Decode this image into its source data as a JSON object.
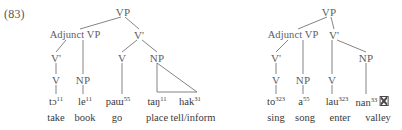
{
  "example": {
    "number_label": "(83)"
  },
  "trees": [
    {
      "id": "tree-left",
      "nodes": {
        "root": "VP",
        "adjunct_vp": "Adjunct VP",
        "v_bar_main": "V'",
        "adjunct_v_bar": "V'",
        "adjunct_v": "V",
        "adjunct_np": "NP",
        "main_v": "V",
        "main_np": "NP"
      },
      "terminals": [
        {
          "ipa_base": "tɔ",
          "ipa_tone": "11",
          "gloss": "take"
        },
        {
          "ipa_base": "le",
          "ipa_tone": "11",
          "gloss": "book"
        },
        {
          "ipa_base": "paɯ",
          "ipa_tone": "55",
          "gloss": "go"
        },
        {
          "ipa_base": "taŋ",
          "ipa_tone": "11",
          "gloss": "place"
        },
        {
          "ipa_base": "hak",
          "ipa_tone": "31",
          "gloss": "tell/inform"
        }
      ]
    },
    {
      "id": "tree-right",
      "nodes": {
        "root": "VP",
        "adjunct_vp": "Adjunct VP",
        "v_bar_main": "V'",
        "adjunct_v_bar": "V'",
        "adjunct_v": "V",
        "adjunct_np": "NP",
        "main_v": "V",
        "main_np": "NP"
      },
      "terminals": [
        {
          "ipa_base": "to",
          "ipa_tone": "323",
          "gloss": "sing"
        },
        {
          "ipa_base": "a",
          "ipa_tone": "55",
          "gloss": "song"
        },
        {
          "ipa_base": "lau",
          "ipa_tone": "323",
          "gloss": "enter"
        },
        {
          "ipa_base": "nan",
          "ipa_tone": "33",
          "gloss": "valley",
          "trailing_missing_glyph": true
        }
      ]
    }
  ],
  "colors": {
    "text": "#3a3a3d",
    "node_text": "#5d5d60",
    "line": "#6e6e71",
    "background": "#ffffff"
  }
}
